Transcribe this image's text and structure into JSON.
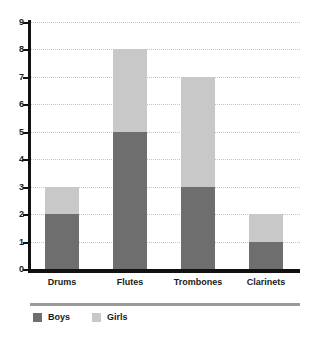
{
  "chart_data": {
    "type": "bar",
    "stacked": true,
    "title": "",
    "subtitle": "",
    "xlabel": "",
    "ylabel": "",
    "categories": [
      "Drums",
      "Flutes",
      "Trombones",
      "Clarinets"
    ],
    "series": [
      {
        "name": "Boys",
        "color": "#6e6e6e",
        "values": [
          2,
          5,
          3,
          1
        ]
      },
      {
        "name": "Girls",
        "color": "#c8c8c8",
        "values": [
          1,
          3,
          4,
          1
        ]
      }
    ],
    "totals": [
      3,
      8,
      7,
      2
    ],
    "ylim": [
      0,
      9
    ],
    "ytick_labels": [
      "0",
      "1",
      "2",
      "3",
      "4",
      "5",
      "6",
      "7",
      "8",
      "9"
    ],
    "ytick_values": [
      0,
      1,
      2,
      3,
      4,
      5,
      6,
      7,
      8,
      9
    ],
    "grid": true,
    "grid_style": "dotted",
    "grid_color": "#c4c4c4",
    "legend_position": "bottom-left",
    "axis_color": "#111111",
    "background": "#ffffff"
  },
  "legend": {
    "items": [
      {
        "label": "Boys"
      },
      {
        "label": "Girls"
      }
    ]
  }
}
